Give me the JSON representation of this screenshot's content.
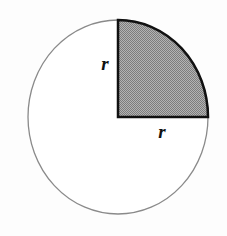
{
  "figure": {
    "name": "quarter-circle-sector-diagram",
    "background_color": "#fdfdfd"
  },
  "circle": {
    "center_x": 118,
    "center_y": 117,
    "radius_x": 90,
    "radius_y": 97,
    "outline_color": "#8a8a8a",
    "outline_width": 1.3,
    "fill_color": "#ffffff"
  },
  "sector": {
    "label": "shaded-quarter",
    "quadrant": "upper-right",
    "start_angle_deg": 0,
    "end_angle_deg": 90,
    "sweep_deg": 90,
    "fill_color": "#999999",
    "fill_pattern": "50-percent-dither",
    "outline_color": "#111111",
    "outline_width": 2.5,
    "vertex_center": [
      118,
      117
    ],
    "vertex_top": [
      118,
      20
    ],
    "vertex_right": [
      208,
      117
    ]
  },
  "labels": {
    "vertical_radius": {
      "text": "r",
      "x": 105,
      "y": 70,
      "anchor": "middle"
    },
    "horizontal_radius": {
      "text": "r",
      "x": 162,
      "y": 138,
      "anchor": "middle"
    }
  }
}
